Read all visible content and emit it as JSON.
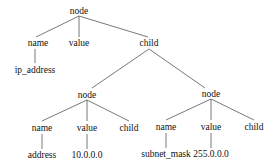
{
  "diagram": {
    "type": "tree",
    "nodes": [
      {
        "id": "n0",
        "label": "node",
        "x": 79,
        "y": 14
      },
      {
        "id": "n1",
        "label": "name",
        "x": 38,
        "y": 46
      },
      {
        "id": "n2",
        "label": "value",
        "x": 79,
        "y": 46
      },
      {
        "id": "n3",
        "label": "child",
        "x": 149,
        "y": 46
      },
      {
        "id": "n4",
        "label": "ip_address",
        "x": 35,
        "y": 73
      },
      {
        "id": "n5",
        "label": "node",
        "x": 87,
        "y": 98
      },
      {
        "id": "n6",
        "label": "node",
        "x": 211,
        "y": 97
      },
      {
        "id": "n7",
        "label": "name",
        "x": 42,
        "y": 131
      },
      {
        "id": "n8",
        "label": "value",
        "x": 87,
        "y": 131
      },
      {
        "id": "n9",
        "label": "child",
        "x": 129,
        "y": 131
      },
      {
        "id": "n10",
        "label": "name",
        "x": 166,
        "y": 130
      },
      {
        "id": "n11",
        "label": "value",
        "x": 211,
        "y": 130
      },
      {
        "id": "n12",
        "label": "child",
        "x": 254,
        "y": 130
      },
      {
        "id": "n13",
        "label": "address",
        "x": 42,
        "y": 158
      },
      {
        "id": "n14",
        "label": "10.0.0.0",
        "x": 87,
        "y": 158
      },
      {
        "id": "n15",
        "label": "subnet_mask",
        "x": 166,
        "y": 157
      },
      {
        "id": "n16",
        "label": "255.0.0.0",
        "x": 211,
        "y": 157
      }
    ],
    "edges": [
      {
        "from": "n0",
        "to": "n1",
        "x1": 79,
        "y1": 16,
        "x2": 36,
        "y2": 37
      },
      {
        "from": "n0",
        "to": "n2",
        "x1": 79,
        "y1": 16,
        "x2": 79,
        "y2": 37
      },
      {
        "from": "n0",
        "to": "n3",
        "x1": 79,
        "y1": 16,
        "x2": 148,
        "y2": 37
      },
      {
        "from": "n1",
        "to": "n4",
        "x1": 35,
        "y1": 49,
        "x2": 35,
        "y2": 63
      },
      {
        "from": "n3",
        "to": "n5",
        "x1": 149,
        "y1": 49,
        "x2": 92,
        "y2": 88
      },
      {
        "from": "n3",
        "to": "n6",
        "x1": 149,
        "y1": 49,
        "x2": 205,
        "y2": 88
      },
      {
        "from": "n5",
        "to": "n7",
        "x1": 87,
        "y1": 100,
        "x2": 42,
        "y2": 121
      },
      {
        "from": "n5",
        "to": "n8",
        "x1": 87,
        "y1": 100,
        "x2": 87,
        "y2": 121
      },
      {
        "from": "n5",
        "to": "n9",
        "x1": 87,
        "y1": 100,
        "x2": 129,
        "y2": 121
      },
      {
        "from": "n6",
        "to": "n10",
        "x1": 211,
        "y1": 99,
        "x2": 166,
        "y2": 120
      },
      {
        "from": "n6",
        "to": "n11",
        "x1": 211,
        "y1": 99,
        "x2": 211,
        "y2": 120
      },
      {
        "from": "n6",
        "to": "n12",
        "x1": 211,
        "y1": 99,
        "x2": 254,
        "y2": 120
      },
      {
        "from": "n7",
        "to": "n13",
        "x1": 42,
        "y1": 134,
        "x2": 42,
        "y2": 149
      },
      {
        "from": "n8",
        "to": "n14",
        "x1": 87,
        "y1": 134,
        "x2": 87,
        "y2": 149
      },
      {
        "from": "n10",
        "to": "n15",
        "x1": 166,
        "y1": 133,
        "x2": 166,
        "y2": 148
      },
      {
        "from": "n11",
        "to": "n16",
        "x1": 211,
        "y1": 133,
        "x2": 211,
        "y2": 148
      }
    ]
  }
}
